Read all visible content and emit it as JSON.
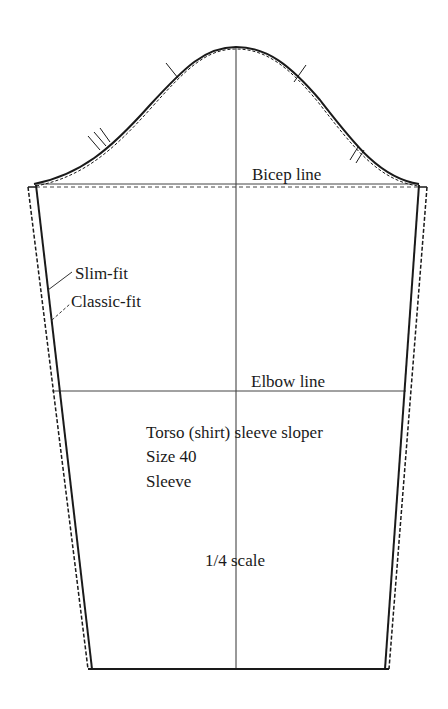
{
  "diagram": {
    "title": "Torso (shirt) sleeve sloper",
    "size": "Size 40",
    "piece": "Sleeve",
    "scale": "1/4 scale",
    "reference_lines": {
      "bicep": "Bicep line",
      "elbow": "Elbow line"
    },
    "legend": {
      "slim_fit": "Slim-fit",
      "classic_fit": "Classic-fit"
    },
    "colors": {
      "outline": "#1a1a1a",
      "guide": "#333333",
      "background": "#ffffff"
    }
  }
}
